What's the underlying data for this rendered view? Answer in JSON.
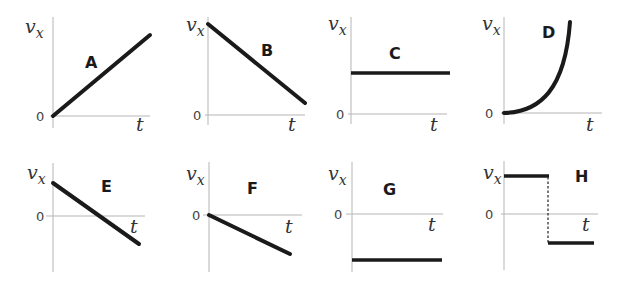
{
  "axis_labels": {
    "y_main": "v",
    "y_sub": "x",
    "x": "t",
    "origin": "0"
  },
  "panels": [
    {
      "id": "A",
      "label": "A",
      "shape": "linear increasing from 0"
    },
    {
      "id": "B",
      "label": "B",
      "shape": "linear decreasing from positive to near 0"
    },
    {
      "id": "C",
      "label": "C",
      "shape": "constant positive"
    },
    {
      "id": "D",
      "label": "D",
      "shape": "curved increasing from 0 (accelerating)"
    },
    {
      "id": "E",
      "label": "E",
      "shape": "linear decreasing from positive through 0 to negative"
    },
    {
      "id": "F",
      "label": "F",
      "shape": "linear decreasing from 0 to negative"
    },
    {
      "id": "G",
      "label": "G",
      "shape": "constant negative"
    },
    {
      "id": "H",
      "label": "H",
      "shape": "constant positive then abrupt jump to constant negative"
    }
  ],
  "colors": {
    "curve": "#1a1a1a",
    "axis": "#b5b5b5"
  }
}
